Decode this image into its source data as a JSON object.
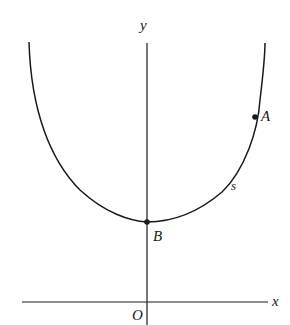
{
  "diagram": {
    "type": "catenary-curve-on-axes",
    "axes": {
      "x_label": "x",
      "y_label": "y",
      "origin_label": "O"
    },
    "curve": {
      "arc_label": "s"
    },
    "points": [
      {
        "id": "A",
        "label": "A"
      },
      {
        "id": "B",
        "label": "B"
      }
    ],
    "colors": {
      "ink": "#1a1a1a",
      "background": "#ffffff"
    }
  }
}
